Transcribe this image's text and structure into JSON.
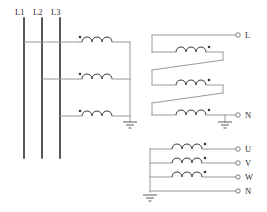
{
  "diagram": {
    "primary": {
      "phase_labels": [
        "L1",
        "L2",
        "L3"
      ],
      "coil_count": 3,
      "polarity_marker": "dot",
      "grounded": true,
      "ground_symbol": "earth-ground"
    },
    "secondary_upper": {
      "connection": "series-zigzag",
      "coil_count": 3,
      "polarity_marker": "dot",
      "terminals": [
        {
          "id": "L",
          "label": "L"
        },
        {
          "id": "N",
          "label": "N"
        }
      ],
      "grounded": true
    },
    "secondary_lower": {
      "connection": "star-wye",
      "coil_count": 3,
      "polarity_marker": "dot",
      "terminals": [
        {
          "id": "U",
          "label": "U"
        },
        {
          "id": "V",
          "label": "V"
        },
        {
          "id": "W",
          "label": "W"
        },
        {
          "id": "N",
          "label": "N"
        }
      ],
      "neutral_grounded": true
    },
    "colors": {
      "background": "#ffffff",
      "bus_line": "#3a3a3a",
      "wire": "#8e8e8e",
      "coil": "#3a3a3a",
      "text": "#2b2b2b",
      "terminal": "#6e6e6e"
    }
  }
}
